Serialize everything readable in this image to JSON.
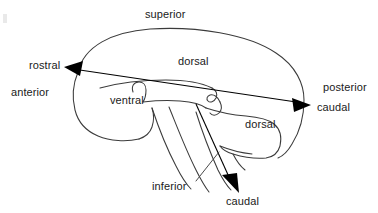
{
  "figure": {
    "background_color": "#ffffff",
    "line_color": "#3b3b3b",
    "arrow_color": "#000000",
    "text_color": "#1a1a1a",
    "width": 378,
    "height": 213
  },
  "labels": {
    "superior": "superior",
    "inferior": "inferior",
    "anterior": "anterior",
    "posterior": "posterior",
    "rostral": "rostral",
    "caudal_horizontal": "caudal",
    "caudal_vertical": "caudal",
    "dorsal_cerebrum": "dorsal",
    "dorsal_brainstem": "dorsal",
    "ventral_cerebrum": "ventral"
  },
  "axes": [
    {
      "name": "rostral-caudal-forebrain-axis",
      "from_label": "rostral",
      "to_label": "caudal",
      "orientation": "horizontal",
      "start": [
        65,
        68
      ],
      "end": [
        308,
        104
      ],
      "arrowheads": "both"
    },
    {
      "name": "rostral-caudal-brainstem-axis",
      "from_label": "inferior",
      "to_label": "caudal",
      "orientation": "oblique-descending",
      "start": [
        196,
        103
      ],
      "end": [
        240,
        190
      ],
      "arrowheads": "end"
    }
  ],
  "icons": {
    "arrowhead_left": "triangle-left-icon",
    "arrowhead_right": "triangle-right-icon",
    "arrowhead_down": "triangle-down-icon"
  }
}
